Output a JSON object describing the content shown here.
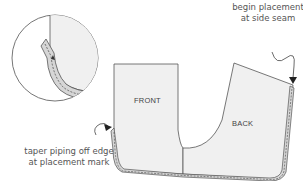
{
  "diagram": {
    "panels": {
      "front": "FRONT",
      "back": "BACK"
    },
    "annotations": {
      "begin": {
        "line1": "begin placement",
        "line2": "at side seam"
      },
      "taper": {
        "line1": "taper piping off edge",
        "line2": "at placement mark"
      }
    },
    "inset": "detail-circle-piping-taper",
    "colors": {
      "panel_fill": "#f0f0f0",
      "piping_fill": "#d6d6d6",
      "outline": "#555555",
      "text": "#555555"
    }
  }
}
